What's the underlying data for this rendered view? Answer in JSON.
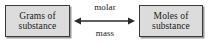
{
  "diagram": {
    "type": "conversion-relationship",
    "colors": {
      "box_fill": "#dcdcdc",
      "box_border": "#3a3a3a",
      "box_shadow": "#9a9a9a",
      "text": "#1a1a1a",
      "arrow": "#2a2a2a",
      "background": "#ffffff"
    },
    "left_box": {
      "icon": "rounded-rectangle-box",
      "line1": "Grams of",
      "line2": "substance"
    },
    "right_box": {
      "icon": "rounded-rectangle-box",
      "line1": "Moles of",
      "line2": "substance"
    },
    "connector": {
      "icon": "double-headed-arrow-icon",
      "direction": "bidirectional",
      "label_above": "molar",
      "label_below": "mass"
    }
  }
}
